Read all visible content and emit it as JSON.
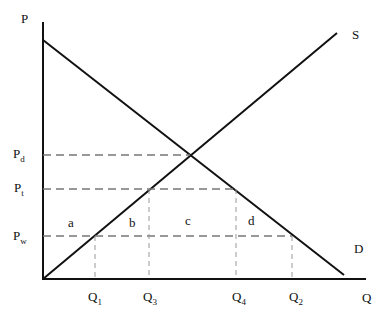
{
  "diagram": {
    "axes": {
      "y_label": "P",
      "x_label": "Q"
    },
    "curves": {
      "supply_label": "S",
      "demand_label": "D"
    },
    "price_levels": [
      {
        "id": "Pd",
        "base": "P",
        "sub": "d"
      },
      {
        "id": "Pt",
        "base": "P",
        "sub": "t"
      },
      {
        "id": "Pw",
        "base": "P",
        "sub": "w"
      }
    ],
    "quantity_levels": [
      {
        "id": "Q1",
        "base": "Q",
        "sub": "1"
      },
      {
        "id": "Q3",
        "base": "Q",
        "sub": "3"
      },
      {
        "id": "Q4",
        "base": "Q",
        "sub": "4"
      },
      {
        "id": "Q2",
        "base": "Q",
        "sub": "2"
      }
    ],
    "areas": {
      "a": "a",
      "b": "b",
      "c": "c",
      "d": "d"
    }
  }
}
